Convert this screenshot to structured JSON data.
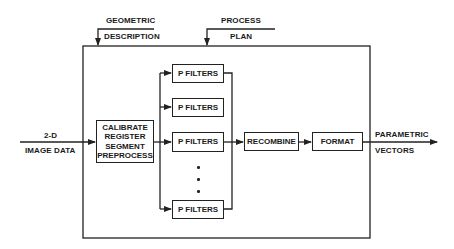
{
  "diagram": {
    "type": "block-diagram",
    "inputs": {
      "geometric": {
        "line1": "GEOMETRIC",
        "line2": "DESCRIPTION"
      },
      "process": {
        "line1": "PROCESS",
        "line2": "PLAN"
      },
      "image": {
        "line1": "2-D",
        "line2": "IMAGE DATA"
      }
    },
    "output": {
      "line1": "PARAMETRIC",
      "line2": "VECTORS"
    },
    "blocks": {
      "preprocess": {
        "lines": [
          "CALIBRATE",
          "REGISTER",
          "SEGMENT",
          "PREPROCESS"
        ]
      },
      "filters": [
        "P FILTERS",
        "P FILTERS",
        "P FILTERS",
        "P FILTERS"
      ],
      "recombine": "RECOMBINE",
      "format": "FORMAT"
    },
    "ellipsis": "⋮",
    "colors": {
      "line": "#222222",
      "background": "#ffffff",
      "text": "#1a1a1a"
    }
  }
}
